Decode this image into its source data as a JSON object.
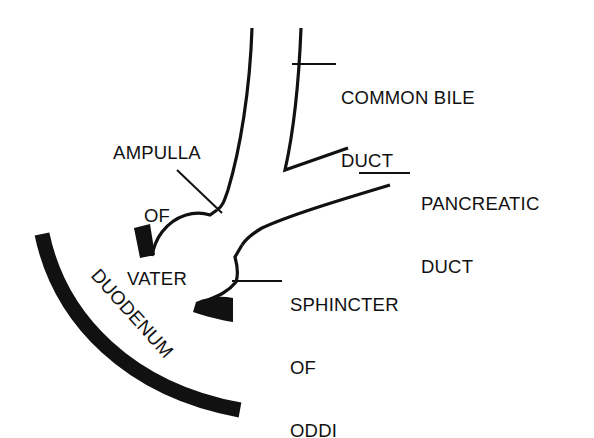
{
  "diagram": {
    "colors": {
      "stroke": "#111111",
      "background": "#ffffff"
    },
    "labels": {
      "common_bile_duct": {
        "line1": "COMMON BILE",
        "line2": "DUCT"
      },
      "ampulla_of_vater": {
        "line1": "AMPULLA",
        "line2": "OF",
        "line3": "VATER"
      },
      "pancreatic_duct": {
        "line1": "PANCREATIC",
        "line2": "DUCT"
      },
      "sphincter_of_oddi": {
        "line1": "SPHINCTER",
        "line2": "OF",
        "line3": "ODDI"
      },
      "duodenum": {
        "text": "DUODENUM"
      }
    }
  }
}
